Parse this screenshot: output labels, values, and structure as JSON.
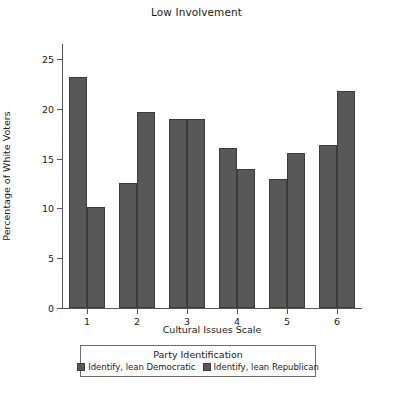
{
  "chart_data": {
    "type": "bar",
    "title": "Low Involvement",
    "xlabel": "Cultural Issues Scale",
    "ylabel": "Percentage of White Voters",
    "categories": [
      "1",
      "2",
      "3",
      "4",
      "5",
      "6"
    ],
    "series": [
      {
        "name": "Identify, lean Democratic",
        "color": "#585858",
        "values": [
          23.2,
          12.5,
          19.0,
          16.1,
          13.0,
          16.4
        ]
      },
      {
        "name": "Identify, lean Republican",
        "color": "#585858",
        "values": [
          10.1,
          19.7,
          19.0,
          14.0,
          15.6,
          21.8
        ]
      }
    ],
    "ylim": [
      0,
      26.5
    ],
    "yticks": [
      0,
      5,
      10,
      15,
      20,
      25
    ],
    "ytick_labels": [
      "0",
      "5",
      "10",
      "15",
      "20",
      "25"
    ],
    "grid": false,
    "legend_position": "below-axes",
    "legend_title": "Party Identification"
  },
  "colors": {
    "bar_fill": "#585858",
    "bar_edge": "#3b3b3b",
    "axis": "#555555",
    "text": "#1a1a1a",
    "background": "#ffffff"
  }
}
